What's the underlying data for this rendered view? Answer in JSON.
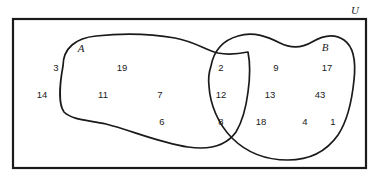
{
  "diagram": {
    "type": "venn-diagram",
    "stroke_color": "#1a1a1a",
    "background_color": "#ffffff",
    "universe": {
      "label": "U",
      "label_x": 355,
      "label_y": 11,
      "rect": {
        "x": 13,
        "y": 19,
        "width": 353,
        "height": 149
      }
    },
    "sets": [
      {
        "id": "A",
        "label": "A",
        "label_x": 81,
        "label_y": 49,
        "path": "M 63 66 C 63 48, 76 38, 96 36 C 124 33, 152 34, 175 38 C 196 42, 205 50, 218 53 C 228 55, 238 54, 248 52 C 250 62, 250 78, 248 92 C 246 108, 242 122, 236 132 C 226 146, 208 150, 188 147 C 160 143, 130 130, 106 124 C 88 120, 72 120, 64 112 C 58 104, 60 82, 63 66 Z"
      },
      {
        "id": "B",
        "label": "B",
        "label_x": 325,
        "label_y": 48,
        "path": "M 211 66 C 214 50, 224 40, 238 36 C 254 31, 268 37, 280 43 C 292 49, 302 48, 312 42 C 322 36, 334 33, 344 40 C 354 47, 356 62, 354 80 C 352 100, 348 120, 338 135 C 326 152, 308 160, 288 160 C 266 160, 246 152, 232 138 C 218 124, 210 104, 209 86 C 208 78, 209 72, 211 66 Z"
      }
    ],
    "regions": {
      "a_only": {
        "name": "A only",
        "elements": [
          {
            "value": "3",
            "x": 56,
            "y": 68
          },
          {
            "value": "19",
            "x": 122,
            "y": 68
          },
          {
            "value": "14",
            "x": 42,
            "y": 95
          },
          {
            "value": "11",
            "x": 103,
            "y": 95
          },
          {
            "value": "7",
            "x": 160,
            "y": 95
          },
          {
            "value": "6",
            "x": 162,
            "y": 122
          }
        ]
      },
      "intersection": {
        "name": "A intersect B",
        "elements": [
          {
            "value": "2",
            "x": 221,
            "y": 68
          },
          {
            "value": "12",
            "x": 221,
            "y": 95
          },
          {
            "value": "8",
            "x": 221,
            "y": 122
          }
        ]
      },
      "b_only": {
        "name": "B only",
        "elements": [
          {
            "value": "9",
            "x": 276,
            "y": 68
          },
          {
            "value": "17",
            "x": 327,
            "y": 68
          },
          {
            "value": "13",
            "x": 270,
            "y": 95
          },
          {
            "value": "43",
            "x": 320,
            "y": 95
          },
          {
            "value": "18",
            "x": 261,
            "y": 122
          },
          {
            "value": "4",
            "x": 305,
            "y": 122
          },
          {
            "value": "1",
            "x": 333,
            "y": 122
          }
        ]
      }
    }
  }
}
